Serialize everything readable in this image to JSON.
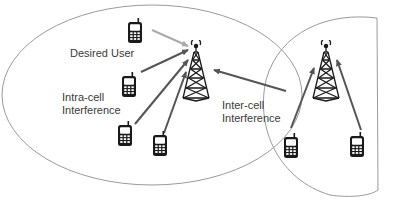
{
  "diagram": {
    "type": "cellular-interference",
    "colors": {
      "cell_boundary": "#9a9a9a",
      "desired_link": "#aaaaaa",
      "interference_link": "#555555",
      "icon": "#1a1a1a",
      "text": "#3a3a3a"
    },
    "labels": {
      "desired_user": "Desired User",
      "intra_cell_line1": "Intra-cell",
      "intra_cell_line2": "Interference",
      "inter_cell_line1": "Inter-cell",
      "inter_cell_line2": "Interference"
    },
    "cells": [
      {
        "name": "serving-cell",
        "tower": "base-station-1",
        "users": [
          "desired-user",
          "intra-user-1",
          "intra-user-2",
          "intra-user-3"
        ]
      },
      {
        "name": "neighbor-cell",
        "tower": "base-station-2",
        "users": [
          "neighbor-user-1",
          "neighbor-user-2"
        ]
      }
    ],
    "links": [
      {
        "from": "desired-user",
        "to": "base-station-1",
        "kind": "desired"
      },
      {
        "from": "intra-user-1",
        "to": "base-station-1",
        "kind": "intra-cell interference"
      },
      {
        "from": "intra-user-2",
        "to": "base-station-1",
        "kind": "intra-cell interference"
      },
      {
        "from": "intra-user-3",
        "to": "base-station-1",
        "kind": "intra-cell interference"
      },
      {
        "from": "neighbor-cell",
        "to": "base-station-1",
        "kind": "inter-cell interference"
      },
      {
        "from": "neighbor-user-1",
        "to": "base-station-2",
        "kind": "uplink"
      },
      {
        "from": "neighbor-user-2",
        "to": "base-station-2",
        "kind": "uplink"
      }
    ]
  }
}
